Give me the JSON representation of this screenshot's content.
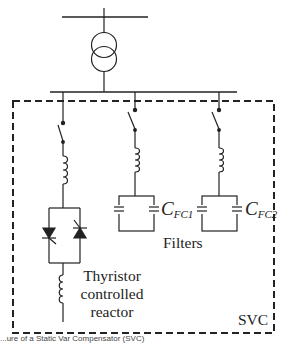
{
  "diagram": {
    "title": "Static Var Compensator (SVC)",
    "labels": {
      "svc": "SVC",
      "filters": "Filters",
      "tcr_line1": "Thyristor",
      "tcr_line2": "controlled",
      "tcr_line3": "reactor",
      "cfc1_main": "C",
      "cfc1_sub": "FC1",
      "cfc2_main": "C",
      "cfc2_sub": "FC2"
    },
    "caption": "...ure of a Static Var Compensator (SVC)",
    "components": [
      "top-bus",
      "transformer",
      "lower-bus",
      "tcr-branch",
      "filter-branch-1",
      "filter-branch-2",
      "svc-boundary"
    ],
    "colors": {
      "line": "#222222",
      "background": "#ffffff"
    }
  }
}
